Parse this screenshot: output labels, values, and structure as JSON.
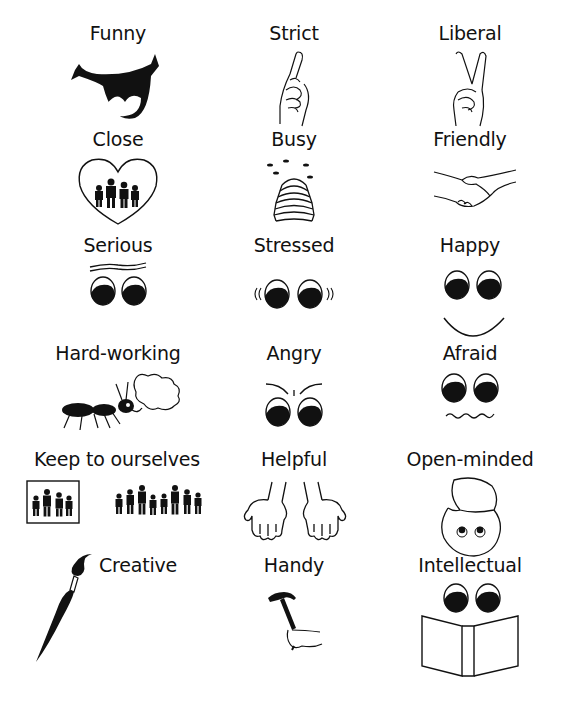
{
  "page": {
    "title_fragment": "",
    "background": "#ffffff",
    "ink": "#111111"
  },
  "grid": {
    "rows": [
      {
        "cells": [
          {
            "label": "Funny",
            "icon": "laughing-mouth-icon"
          },
          {
            "label": "Strict",
            "icon": "pointing-finger-icon"
          },
          {
            "label": "Liberal",
            "icon": "peace-sign-hand-icon"
          }
        ]
      },
      {
        "cells": [
          {
            "label": "Close",
            "icon": "heart-with-family-icon"
          },
          {
            "label": "Busy",
            "icon": "beehive-icon"
          },
          {
            "label": "Friendly",
            "icon": "handshake-icon"
          }
        ]
      },
      {
        "cells": [
          {
            "label": "Serious",
            "icon": "serious-eyes-icon"
          },
          {
            "label": "Stressed",
            "icon": "stressed-eyes-icon"
          },
          {
            "label": "Happy",
            "icon": "smiling-face-icon"
          }
        ]
      },
      {
        "cells": [
          {
            "label": "Hard-working",
            "icon": "ant-carrying-load-icon"
          },
          {
            "label": "Angry",
            "icon": "angry-eyes-icon"
          },
          {
            "label": "Afraid",
            "icon": "afraid-face-icon"
          }
        ]
      },
      {
        "cells": [
          {
            "label": "Keep to ourselves",
            "icon": "boxed-family-icon"
          },
          {
            "label": "Helpful",
            "icon": "open-hands-icon"
          },
          {
            "label": "Open-minded",
            "icon": "open-head-icon"
          }
        ]
      },
      {
        "cells": [
          {
            "label": "Creative",
            "icon": "paintbrush-icon"
          },
          {
            "label": "Handy",
            "icon": "hammer-in-hand-icon"
          },
          {
            "label": "Intellectual",
            "icon": "eyes-reading-book-icon"
          }
        ]
      }
    ]
  }
}
